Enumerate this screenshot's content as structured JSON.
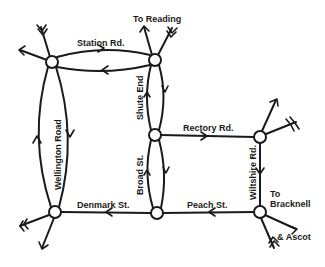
{
  "diagram": {
    "colors": {
      "line": "#1a1a1a",
      "background": "#ffffff",
      "node_fill": "#ffffff"
    },
    "nodes": [
      {
        "id": "N1",
        "x": 52,
        "y": 62
      },
      {
        "id": "N2",
        "x": 155,
        "y": 60
      },
      {
        "id": "N3",
        "x": 155,
        "y": 135
      },
      {
        "id": "N4",
        "x": 260,
        "y": 137
      },
      {
        "id": "N5",
        "x": 55,
        "y": 212
      },
      {
        "id": "N6",
        "x": 157,
        "y": 213
      },
      {
        "id": "N7",
        "x": 260,
        "y": 212
      }
    ],
    "roads": {
      "station_rd": "Station Rd.",
      "shute_end": "Shute End",
      "wellington_road": "Wellington Road",
      "rectory_rd": "Rectory Rd.",
      "broad_st": "Broad St.",
      "wiltshire_rd": "Wiltshire Rd.",
      "denmark_st": "Denmark St.",
      "peach_st": "Peach St."
    },
    "destinations": {
      "reading": "To Reading",
      "bracknell_line1": "To",
      "bracknell_line2": "Bracknell",
      "ascot": "& Ascot"
    }
  }
}
